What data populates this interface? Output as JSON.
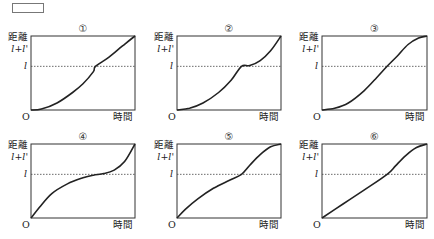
{
  "answer_box": "",
  "chart_data": [
    {
      "type": "line",
      "title": "①",
      "xlabel": "時間",
      "ylabel": "距離",
      "origin": "O",
      "y_ticks": [
        "l+l'",
        "l"
      ],
      "reference_line": "l",
      "ylim": [
        0,
        1
      ],
      "level_l": 0.5,
      "points": [
        [
          0,
          0
        ],
        [
          0.1,
          0.01
        ],
        [
          0.25,
          0.08
        ],
        [
          0.4,
          0.2
        ],
        [
          0.5,
          0.3
        ],
        [
          0.6,
          0.44
        ],
        [
          0.62,
          0.5
        ],
        [
          0.75,
          0.63
        ],
        [
          0.88,
          0.79
        ],
        [
          1,
          0.93
        ]
      ]
    },
    {
      "type": "line",
      "title": "②",
      "xlabel": "時間",
      "ylabel": "距離",
      "origin": "O",
      "y_ticks": [
        "l+l'",
        "l"
      ],
      "reference_line": "l",
      "ylim": [
        0,
        1
      ],
      "level_l": 0.5,
      "points": [
        [
          0,
          0
        ],
        [
          0.12,
          0.02
        ],
        [
          0.25,
          0.08
        ],
        [
          0.4,
          0.2
        ],
        [
          0.52,
          0.34
        ],
        [
          0.62,
          0.5
        ],
        [
          0.7,
          0.51
        ],
        [
          0.8,
          0.58
        ],
        [
          0.9,
          0.72
        ],
        [
          1,
          0.93
        ]
      ]
    },
    {
      "type": "line",
      "title": "③",
      "xlabel": "時間",
      "ylabel": "距離",
      "origin": "O",
      "y_ticks": [
        "l+l'",
        "l"
      ],
      "reference_line": "l",
      "ylim": [
        0,
        1
      ],
      "level_l": 0.5,
      "points": [
        [
          0,
          0
        ],
        [
          0.12,
          0.02
        ],
        [
          0.25,
          0.08
        ],
        [
          0.4,
          0.22
        ],
        [
          0.52,
          0.37
        ],
        [
          0.62,
          0.5
        ],
        [
          0.72,
          0.65
        ],
        [
          0.82,
          0.81
        ],
        [
          0.92,
          0.9
        ],
        [
          1,
          0.93
        ]
      ]
    },
    {
      "type": "line",
      "title": "④",
      "xlabel": "時間",
      "ylabel": "距離",
      "origin": "O",
      "y_ticks": [
        "l+l'",
        "l"
      ],
      "reference_line": "l",
      "ylim": [
        0,
        1
      ],
      "level_l": 0.5,
      "points": [
        [
          0,
          0
        ],
        [
          0.08,
          0.12
        ],
        [
          0.2,
          0.28
        ],
        [
          0.35,
          0.39
        ],
        [
          0.5,
          0.46
        ],
        [
          0.6,
          0.49
        ],
        [
          0.7,
          0.51
        ],
        [
          0.8,
          0.56
        ],
        [
          0.9,
          0.68
        ],
        [
          1,
          0.93
        ]
      ]
    },
    {
      "type": "line",
      "title": "⑤",
      "xlabel": "時間",
      "ylabel": "距離",
      "origin": "O",
      "y_ticks": [
        "l+l'",
        "l"
      ],
      "reference_line": "l",
      "ylim": [
        0,
        1
      ],
      "level_l": 0.5,
      "points": [
        [
          0,
          0
        ],
        [
          0.08,
          0.1
        ],
        [
          0.2,
          0.22
        ],
        [
          0.35,
          0.34
        ],
        [
          0.5,
          0.43
        ],
        [
          0.62,
          0.5
        ],
        [
          0.7,
          0.63
        ],
        [
          0.8,
          0.78
        ],
        [
          0.9,
          0.89
        ],
        [
          1,
          0.93
        ]
      ]
    },
    {
      "type": "line",
      "title": "⑥",
      "xlabel": "時間",
      "ylabel": "距離",
      "origin": "O",
      "y_ticks": [
        "l+l'",
        "l"
      ],
      "reference_line": "l",
      "ylim": [
        0,
        1
      ],
      "level_l": 0.5,
      "points": [
        [
          0,
          0
        ],
        [
          0.2,
          0.16
        ],
        [
          0.4,
          0.32
        ],
        [
          0.62,
          0.5
        ],
        [
          0.7,
          0.62
        ],
        [
          0.8,
          0.77
        ],
        [
          0.9,
          0.88
        ],
        [
          1,
          0.93
        ]
      ]
    }
  ]
}
